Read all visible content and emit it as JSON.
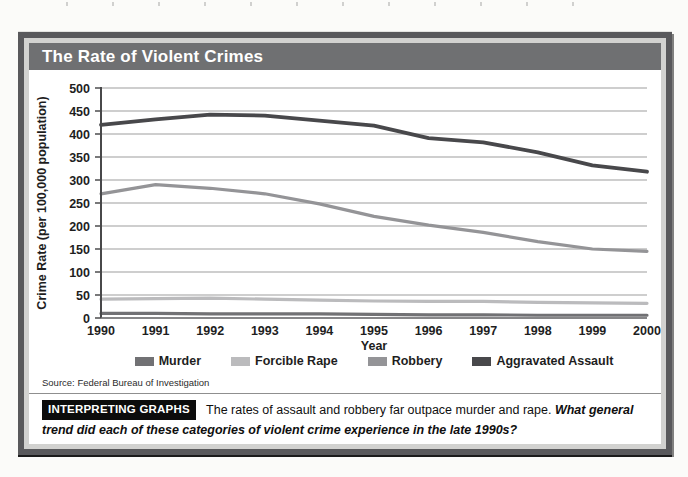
{
  "figure": {
    "title": "The Rate of Violent Crimes",
    "source": "Source: Federal Bureau of Investigation",
    "interpreting": {
      "badge": "INTERPRETING GRAPHS",
      "text": "The rates of assault and robbery far outpace murder and rape.",
      "question": "What general trend did each of these categories of violent crime experience in the late 1990s?"
    }
  },
  "chart_data": {
    "type": "line",
    "title": "The Rate of Violent Crimes",
    "xlabel": "Year",
    "ylabel": "Crime Rate (per 100,000 population)",
    "ylim": [
      0,
      500
    ],
    "ytick_interval": 50,
    "grid": true,
    "legend_position": "bottom",
    "categories": [
      1990,
      1991,
      1992,
      1993,
      1994,
      1995,
      1996,
      1997,
      1998,
      1999,
      2000
    ],
    "series": [
      {
        "name": "Murder",
        "color": "#717174",
        "values": [
          10,
          10,
          9,
          9,
          9,
          8,
          7,
          7,
          6,
          6,
          6
        ]
      },
      {
        "name": "Forcible Rape",
        "color": "#bbbbbd",
        "values": [
          41,
          42,
          43,
          41,
          39,
          37,
          36,
          36,
          34,
          33,
          32
        ]
      },
      {
        "name": "Robbery",
        "color": "#949497",
        "values": [
          270,
          290,
          282,
          270,
          248,
          221,
          202,
          186,
          166,
          150,
          145
        ]
      },
      {
        "name": "Aggravated Assault",
        "color": "#48484b",
        "values": [
          420,
          432,
          442,
          440,
          429,
          418,
          391,
          382,
          360,
          332,
          318
        ]
      }
    ]
  }
}
